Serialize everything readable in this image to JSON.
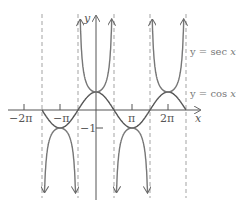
{
  "chart_data": {
    "type": "line",
    "title": "",
    "xlabel": "x",
    "ylabel": "y",
    "x_tick_labels": [
      "-2π",
      "-π",
      "π",
      "2π"
    ],
    "y_tick_labels": [
      "-1"
    ],
    "xlim": [
      -2.6,
      3.1
    ],
    "ylim": [
      -4.8,
      5.1
    ],
    "grid": false,
    "asymptotes_x": [
      "-3π/2",
      "-π/2",
      "π/2",
      "3π/2",
      "5π/2"
    ],
    "series": [
      {
        "name": "y = sec x",
        "function": "sec(x)",
        "style": "solid",
        "arrows": true
      },
      {
        "name": "y = cos x",
        "function": "cos(x)",
        "style": "solid",
        "domain": [
          "-3π/2",
          "5π/2"
        ]
      }
    ],
    "annotations": [
      {
        "text": "y = sec x",
        "position": "right, upper"
      },
      {
        "text": "y = cos x",
        "position": "right, near y=1"
      }
    ]
  },
  "labels": {
    "y_axis": "y",
    "x_axis": "x",
    "neg_two_pi": "−2π",
    "neg_pi": "−π",
    "pi": "π",
    "two_pi": "2π",
    "neg_one": "−1",
    "sec_label_prefix": "y = sec ",
    "sec_label_var": "x",
    "cos_label_prefix": "y = cos ",
    "cos_label_var": "x"
  }
}
